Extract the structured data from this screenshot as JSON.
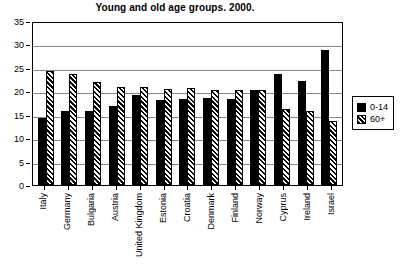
{
  "chart_data": {
    "type": "bar",
    "title": "Young and old age groups. 2000.",
    "xlabel": "",
    "ylabel": "",
    "ylim": [
      0,
      35
    ],
    "yticks": [
      0,
      5,
      10,
      15,
      20,
      25,
      30,
      35
    ],
    "grid": true,
    "legend_position": "right",
    "categories": [
      "Italy",
      "Germany",
      "Bulgaria",
      "Austria",
      "United Kingdom",
      "Estonia",
      "Croatia",
      "Denmark",
      "Finland",
      "Norway",
      "Cyprus",
      "Ireland",
      "Israel"
    ],
    "series": [
      {
        "name": "0-14",
        "pattern": "solid-black",
        "values": [
          14.4,
          15.8,
          15.9,
          16.8,
          19.2,
          18.1,
          18.3,
          18.6,
          18.3,
          20.2,
          23.6,
          22.2,
          28.8
        ]
      },
      {
        "name": "60+",
        "pattern": "diagonal-hatch",
        "values": [
          24.3,
          23.6,
          22.0,
          21.0,
          20.9,
          20.5,
          20.6,
          20.3,
          20.3,
          20.2,
          16.2,
          15.7,
          13.7
        ]
      }
    ]
  },
  "legend": {
    "items": [
      {
        "label": "0-14"
      },
      {
        "label": "60+"
      }
    ]
  },
  "colors": {
    "young": "#000000",
    "old": "#ffffff",
    "frame": "#000000",
    "grid": "#888888",
    "background": "#ffffff"
  }
}
